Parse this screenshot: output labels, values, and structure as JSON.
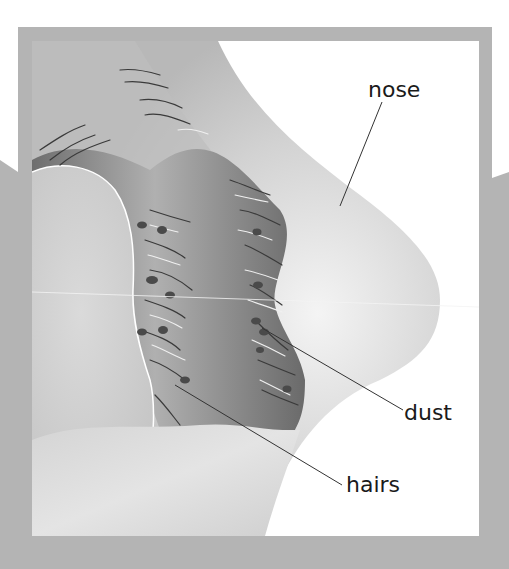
{
  "diagram": {
    "colors": {
      "background": "#ffffff",
      "frame": "#b4b4b4",
      "skin_light": "#e6e6e6",
      "skin_mid": "#c8c8c8",
      "cavity_dark": "#7a7a7a",
      "hair_dark": "#3a3a3a",
      "hair_light": "#f2f2f2",
      "dust": "#4a4a4a",
      "leader_line": "#333333",
      "label_text": "#1a1a1a"
    },
    "labels": [
      {
        "id": "nose",
        "text": "nose",
        "x": 368,
        "y": 79,
        "line": {
          "x1": 382,
          "y1": 102,
          "x2": 340,
          "y2": 206
        }
      },
      {
        "id": "dust",
        "text": "dust",
        "x": 404,
        "y": 402,
        "line": {
          "x1": 262,
          "y1": 328,
          "x2": 403,
          "y2": 410
        }
      },
      {
        "id": "hairs",
        "text": "hairs",
        "x": 346,
        "y": 474,
        "line": {
          "x1": 175,
          "y1": 385,
          "x2": 342,
          "y2": 485
        }
      }
    ]
  }
}
